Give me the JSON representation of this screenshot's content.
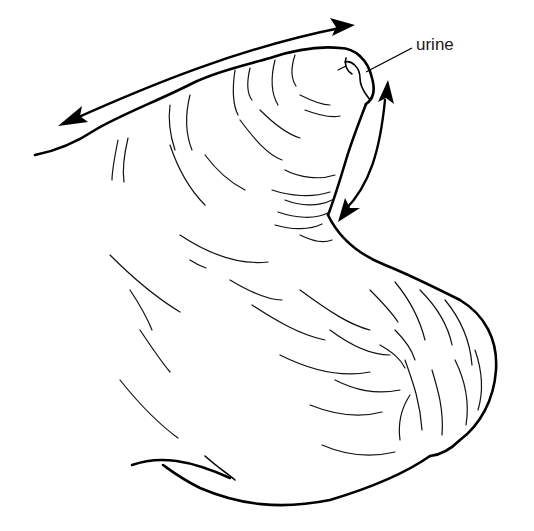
{
  "figure": {
    "background_color": "#ffffff",
    "line_color": "#000000",
    "labels": [
      {
        "id": "urine",
        "text": "urine",
        "x": 418,
        "y": 42
      }
    ],
    "arrows": [
      {
        "id": "top-arrow",
        "type": "double-headed",
        "description": "along the upper edge, pointing left-down and right-up"
      },
      {
        "id": "side-arrow",
        "type": "double-headed",
        "description": "along the right side of the neck, pointing up and down"
      }
    ]
  }
}
